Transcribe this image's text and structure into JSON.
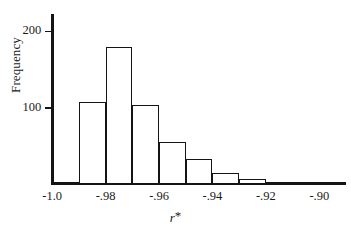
{
  "figure": {
    "background_color": "#ffffff",
    "ink_color": "#141414"
  },
  "axes": {
    "ylabel": "Frequency",
    "xlabel_symbol": "r",
    "xlabel_star": "*",
    "y_ticks": [
      {
        "value": 100,
        "label": "100"
      },
      {
        "value": 200,
        "label": "200"
      }
    ],
    "x_ticks": [
      {
        "value": -1.0,
        "label": "-1.0"
      },
      {
        "value": -0.98,
        "label": "-.98"
      },
      {
        "value": -0.96,
        "label": "-.96"
      },
      {
        "value": -0.94,
        "label": "-.94"
      },
      {
        "value": -0.92,
        "label": "-.92"
      },
      {
        "value": -0.9,
        "label": "-.90"
      }
    ]
  },
  "chart_data": {
    "type": "bar",
    "title": "",
    "subtitle": "",
    "xlabel": "r*",
    "ylabel": "Frequency",
    "grid": false,
    "legend": false,
    "xlim": [
      -1.0,
      -0.89
    ],
    "ylim": [
      0,
      215
    ],
    "bin_width": 0.01,
    "bin_edges": [
      -1.0,
      -0.99,
      -0.98,
      -0.97,
      -0.96,
      -0.95,
      -0.94,
      -0.93,
      -0.92,
      -0.91,
      -0.9,
      -0.89
    ],
    "bin_centers": [
      -0.995,
      -0.985,
      -0.975,
      -0.965,
      -0.955,
      -0.945,
      -0.935,
      -0.925,
      -0.915,
      -0.905,
      -0.895
    ],
    "categories": [
      "-1.00 to -0.99",
      "-0.99 to -0.98",
      "-0.98 to -0.97",
      "-0.97 to -0.96",
      "-0.96 to -0.95",
      "-0.95 to -0.94",
      "-0.94 to -0.93",
      "-0.93 to -0.92",
      "-0.92 to -0.91",
      "-0.91 to -0.90",
      "-0.90 to -0.89"
    ],
    "values": [
      2,
      108,
      180,
      104,
      55,
      33,
      14,
      7,
      3,
      1,
      1
    ],
    "x_tick_labels": [
      "-1.0",
      "-.98",
      "-.96",
      "-.94",
      "-.92",
      "-.90"
    ],
    "x_tick_values": [
      -1.0,
      -0.98,
      -0.96,
      -0.94,
      -0.92,
      -0.9
    ],
    "y_tick_labels": [
      "100",
      "200"
    ],
    "y_tick_values": [
      100,
      200
    ]
  }
}
